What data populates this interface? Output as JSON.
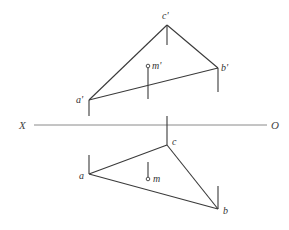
{
  "diagram": {
    "type": "orthographic-projection",
    "axis": {
      "left_label": "X",
      "right_label": "O",
      "y": 125,
      "x1": 34,
      "x2": 267
    },
    "front_view": {
      "points": {
        "a_prime": {
          "label": "a'",
          "x": 89,
          "y": 100
        },
        "b_prime": {
          "label": "b'",
          "x": 218,
          "y": 68
        },
        "c_prime": {
          "label": "c'",
          "x": 167,
          "y": 25
        },
        "m_prime": {
          "label": "m'",
          "x": 148,
          "y": 66
        }
      }
    },
    "top_view": {
      "points": {
        "a": {
          "label": "a",
          "x": 89,
          "y": 174
        },
        "b": {
          "label": "b",
          "x": 218,
          "y": 209
        },
        "c": {
          "label": "c",
          "x": 167,
          "y": 145
        },
        "m": {
          "label": "m",
          "x": 148,
          "y": 179
        }
      }
    },
    "colors": {
      "line": "#3a3a3a",
      "axis": "#8a8a8a",
      "text": "#333333",
      "background": "#ffffff"
    }
  }
}
